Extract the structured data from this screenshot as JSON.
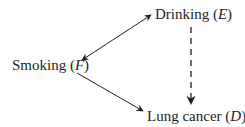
{
  "diagram": {
    "nodes": {
      "drinking": {
        "label": "Drinking",
        "symbol": "E"
      },
      "smoking": {
        "label": "Smoking",
        "symbol": "F"
      },
      "lung_cancer": {
        "label": "Lung cancer",
        "symbol": "D"
      }
    },
    "edges": [
      {
        "from": "smoking",
        "to": "drinking",
        "style": "solid",
        "direction": "bidirectional"
      },
      {
        "from": "smoking",
        "to": "lung_cancer",
        "style": "solid",
        "direction": "forward"
      },
      {
        "from": "drinking",
        "to": "lung_cancer",
        "style": "dashed",
        "direction": "forward"
      }
    ],
    "colors": {
      "ink": "#231f20",
      "background": "#ffffff"
    }
  }
}
